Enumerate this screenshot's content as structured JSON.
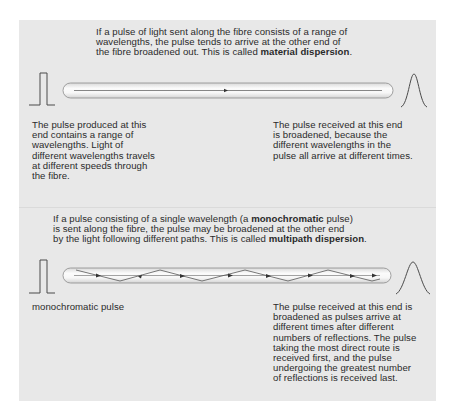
{
  "colors": {
    "panel_bg": "#e8e8e8",
    "text": "#2b2b2b",
    "tube_fill": "#f4f4f4",
    "tube_stroke": "#8a8a8a",
    "ray": "#555555"
  },
  "material_section": {
    "intro": {
      "line1": "If a pulse of light sent along the fibre consists of a range of",
      "line2": "wavelengths, the pulse tends to arrive at the other end of",
      "line3_prefix": "the fibre broadened out. This is called ",
      "line3_bold": "material dispersion",
      "line3_suffix": "."
    },
    "left_caption": {
      "line1": "The pulse produced at this",
      "line2": "end contains a range of",
      "line3": "wavelengths. Light of",
      "line4": "different wavelengths travels",
      "line5": "at different speeds through",
      "line6": "the fibre."
    },
    "right_caption": {
      "line1": "The pulse received at this end",
      "line2": "is broadened, because the",
      "line3": "different wavelengths in the",
      "line4": "pulse all arrive at different times."
    },
    "input_pulse_icon": "square-pulse",
    "output_pulse_icon": "bell-pulse"
  },
  "multipath_section": {
    "intro": {
      "line1_prefix": "If a pulse consisting of a single wavelength (a ",
      "line1_bold": "monochromatic",
      "line1_suffix": " pulse)",
      "line2": "is sent along the fibre, the pulse may be broadened at the other end",
      "line3_prefix": "by the light following different paths. This is called ",
      "line3_bold": "multipath dispersion",
      "line3_suffix": "."
    },
    "left_caption": "monochromatic pulse",
    "right_caption": {
      "line1": "The pulse received at this end is",
      "line2": "broadened as pulses arrive at",
      "line3": "different times after different",
      "line4": "numbers of reflections. The pulse",
      "line5": "taking the most direct route is",
      "line6": "received first, and the pulse",
      "line7": "undergoing the greatest number",
      "line8": "of reflections is received last."
    },
    "input_pulse_icon": "square-pulse",
    "output_pulse_icon": "bell-pulse"
  }
}
